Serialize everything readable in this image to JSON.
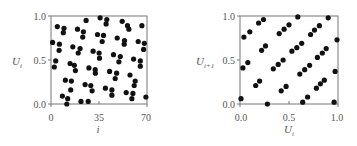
{
  "chart_data": [
    {
      "type": "scatter",
      "title": "",
      "xlabel": "i",
      "ylabel": "U_i",
      "xlim": [
        0,
        70
      ],
      "ylim": [
        0.0,
        1.0
      ],
      "xticks": [
        "0",
        "35",
        "70"
      ],
      "yticks": [
        "0.0",
        "0.5",
        "1.0"
      ],
      "grid": false,
      "legend": null,
      "marker_color": "#111111",
      "points": [
        [
          1.2,
          0.7
        ],
        [
          2.4,
          0.42
        ],
        [
          3.4,
          0.49
        ],
        [
          4.6,
          0.88
        ],
        [
          6.1,
          0.68
        ],
        [
          5.9,
          0.61
        ],
        [
          8.3,
          0.09
        ],
        [
          9.0,
          0.81
        ],
        [
          9.5,
          0.86
        ],
        [
          10.5,
          0.27
        ],
        [
          11.5,
          0.0
        ],
        [
          12.2,
          0.06
        ],
        [
          13.9,
          0.46
        ],
        [
          14.4,
          0.16
        ],
        [
          14.9,
          0.26
        ],
        [
          15.9,
          0.65
        ],
        [
          17.0,
          0.44
        ],
        [
          17.8,
          0.38
        ],
        [
          19.3,
          0.85
        ],
        [
          19.8,
          0.58
        ],
        [
          21.2,
          0.63
        ],
        [
          21.9,
          0.03
        ],
        [
          23.6,
          0.82
        ],
        [
          23.1,
          0.76
        ],
        [
          24.9,
          0.22
        ],
        [
          25.6,
          0.95
        ],
        [
          27.1,
          0.03
        ],
        [
          27.6,
          0.41
        ],
        [
          29.0,
          0.21
        ],
        [
          30.0,
          0.15
        ],
        [
          30.7,
          0.6
        ],
        [
          32.2,
          0.39
        ],
        [
          32.4,
          0.35
        ],
        [
          33.9,
          0.79
        ],
        [
          35.8,
          0.98
        ],
        [
          35.1,
          0.58
        ],
        [
          35.4,
          0.52
        ],
        [
          37.3,
          0.71
        ],
        [
          38.3,
          0.78
        ],
        [
          40.2,
          0.91
        ],
        [
          39.7,
          0.18
        ],
        [
          40.7,
          0.96
        ],
        [
          42.7,
          0.37
        ],
        [
          44.4,
          0.16
        ],
        [
          44.4,
          0.1
        ],
        [
          45.6,
          0.56
        ],
        [
          46.8,
          0.29
        ],
        [
          47.8,
          0.35
        ],
        [
          48.3,
          0.75
        ],
        [
          49.5,
          0.48
        ],
        [
          50.5,
          0.54
        ],
        [
          51.9,
          0.94
        ],
        [
          53.4,
          0.68
        ],
        [
          53.6,
          0.72
        ],
        [
          54.8,
          0.13
        ],
        [
          55.8,
          0.89
        ],
        [
          56.8,
          0.85
        ],
        [
          57.6,
          0.33
        ],
        [
          59.0,
          0.06
        ],
        [
          59.7,
          0.12
        ],
        [
          60.2,
          0.51
        ],
        [
          60.7,
          0.21
        ],
        [
          61.4,
          0.26
        ],
        [
          63.6,
          0.71
        ],
        [
          65.1,
          0.43
        ],
        [
          65.1,
          0.49
        ],
        [
          66.3,
          0.89
        ],
        [
          67.5,
          0.62
        ],
        [
          68.0,
          0.69
        ],
        [
          69.2,
          0.08
        ]
      ]
    },
    {
      "type": "scatter",
      "title": "",
      "xlabel": "U_i",
      "ylabel": "U_{i+1}",
      "xlim": [
        0.0,
        1.0
      ],
      "ylim": [
        0.0,
        1.0
      ],
      "xticks": [
        "0.0",
        "0.5",
        "1.0"
      ],
      "yticks": [
        "0.0",
        "0.5",
        "1.0"
      ],
      "grid": false,
      "legend": null,
      "marker_color": "#111111",
      "points": [
        [
          0.01,
          0.06
        ],
        [
          0.03,
          0.41
        ],
        [
          0.04,
          0.76
        ],
        [
          0.08,
          0.47
        ],
        [
          0.1,
          0.82
        ],
        [
          0.16,
          0.21
        ],
        [
          0.19,
          0.92
        ],
        [
          0.2,
          0.26
        ],
        [
          0.22,
          0.61
        ],
        [
          0.24,
          0.96
        ],
        [
          0.26,
          0.66
        ],
        [
          0.28,
          0.0
        ],
        [
          0.34,
          0.4
        ],
        [
          0.39,
          0.45
        ],
        [
          0.4,
          0.8
        ],
        [
          0.42,
          0.15
        ],
        [
          0.44,
          0.5
        ],
        [
          0.45,
          0.85
        ],
        [
          0.47,
          0.2
        ],
        [
          0.5,
          0.9
        ],
        [
          0.53,
          0.6
        ],
        [
          0.58,
          0.64
        ],
        [
          0.59,
          0.99
        ],
        [
          0.61,
          0.34
        ],
        [
          0.63,
          0.69
        ],
        [
          0.64,
          0.02
        ],
        [
          0.66,
          0.39
        ],
        [
          0.69,
          0.08
        ],
        [
          0.71,
          0.44
        ],
        [
          0.72,
          0.79
        ],
        [
          0.76,
          0.84
        ],
        [
          0.78,
          0.18
        ],
        [
          0.79,
          0.53
        ],
        [
          0.81,
          0.89
        ],
        [
          0.82,
          0.23
        ],
        [
          0.84,
          0.58
        ],
        [
          0.86,
          0.27
        ],
        [
          0.88,
          0.63
        ],
        [
          0.9,
          0.98
        ],
        [
          0.96,
          0.02
        ],
        [
          0.97,
          0.37
        ],
        [
          0.99,
          0.73
        ]
      ]
    }
  ],
  "left_plot": {
    "ylabel_main": "U",
    "ylabel_sub": "i",
    "xlabel": "i",
    "xticks": [
      "0",
      "35",
      "70"
    ],
    "yticks": [
      "0.0",
      "0.5",
      "1.0"
    ]
  },
  "right_plot": {
    "ylabel_main": "U",
    "ylabel_sub": "i+1",
    "xlabel_main": "U",
    "xlabel_sub": "i",
    "xticks": [
      "0.0",
      "0.5",
      "1.0"
    ],
    "yticks": [
      "0.0",
      "0.5",
      "1.0"
    ]
  }
}
